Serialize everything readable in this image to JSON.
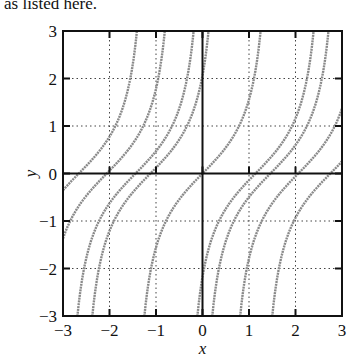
{
  "caption": "as listed here.",
  "chart_data": {
    "type": "line",
    "title": "",
    "xlabel": "x",
    "ylabel": "y",
    "xlim": [
      -3,
      3
    ],
    "ylim": [
      -3,
      3
    ],
    "xticks": [
      "-3",
      "-2",
      "-1",
      "0",
      "1",
      "2",
      "3"
    ],
    "yticks": [
      "-3",
      "-2",
      "-1",
      "0",
      "1",
      "2",
      "3"
    ],
    "grid": "dotted",
    "series_description": "Family of solution curves y = tan(x - c)",
    "shifts_c": [
      -2.66,
      -2.06,
      -1.44,
      -1.12,
      0,
      1.14,
      1.46,
      2.06,
      2.75
    ],
    "curve_color": "#8a8a8a"
  }
}
